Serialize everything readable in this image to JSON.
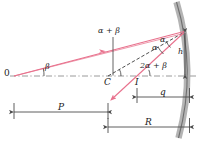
{
  "figure": {
    "type": "optics-ray-diagram",
    "colors": {
      "ray": "#e8718d",
      "line": "#4d4d4d",
      "mirror": "#a8a8a8",
      "axis": "#9a9a9a",
      "text": "#1a1a1a"
    }
  },
  "labels": {
    "object_point": "0",
    "center_of_curvature": "C",
    "image_point": "I",
    "angle_beta": "β",
    "angle_alpha_1": "α",
    "angle_alpha_2": "α",
    "angle_alpha_plus_beta": "α + β",
    "angle_two_alpha_plus_beta": "2α + β",
    "height": "h",
    "image_distance": "q",
    "object_distance": "P",
    "radius": "R"
  },
  "geometry": {
    "object_x": 14,
    "axis_y": 76,
    "center_x": 108,
    "image_x": 137,
    "mirror_vertex_x": 190,
    "hit_point": {
      "x": 184,
      "y": 32
    },
    "height_top_y": 32,
    "dim_q": {
      "x1": 137,
      "x2": 190,
      "y": 97
    },
    "dim_p": {
      "x1": 14,
      "x2": 108,
      "y": 112
    },
    "dim_r": {
      "x1": 108,
      "x2": 190,
      "y": 127
    }
  }
}
